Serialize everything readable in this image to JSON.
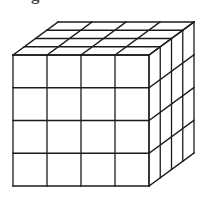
{
  "page": {
    "background": "#ffffff"
  },
  "fragment": {
    "text": "g"
  },
  "cube": {
    "type": "cube-grid-diagram",
    "divisions": {
      "columns": 4,
      "rows": 4,
      "depth": 4
    },
    "geometry": {
      "x": 13,
      "y": 55,
      "front_width": 136,
      "front_height": 131,
      "depth_dx": 45,
      "depth_dy": -33
    },
    "stroke": {
      "color": "#1b1b1b",
      "width": 1.3
    },
    "face_fill": "#ffffff",
    "viewbox": "0 0 205 197"
  }
}
